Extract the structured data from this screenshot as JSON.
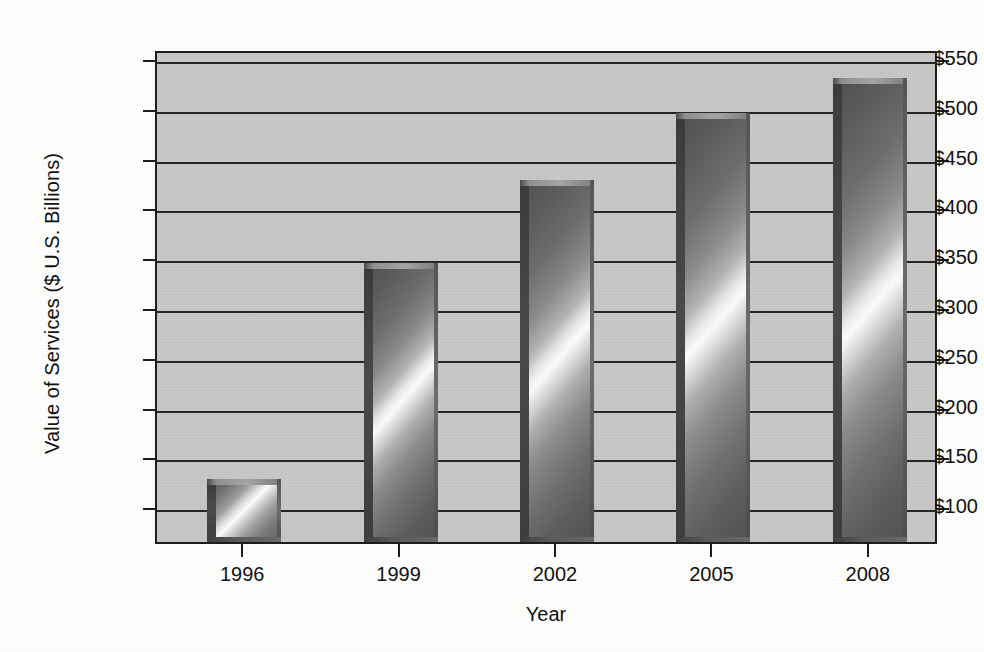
{
  "chart_data": {
    "type": "bar",
    "title": "",
    "xlabel": "Year",
    "ylabel": "Value of Services ($ U.S. Billions)",
    "categories": [
      "1996",
      "1999",
      "2002",
      "2005",
      "2008"
    ],
    "values": [
      128,
      345,
      428,
      496,
      531
    ],
    "ylim": [
      65,
      560
    ],
    "ytick_values": [
      100,
      150,
      200,
      250,
      300,
      350,
      400,
      450,
      500,
      550
    ],
    "ytick_labels": [
      "$100",
      "$150",
      "$200",
      "$250",
      "$300",
      "$350",
      "$400",
      "$450",
      "$500",
      "$550"
    ],
    "grid": true,
    "grid_axis": "y",
    "legend": false,
    "series": [
      {
        "name": "Value of Services",
        "values": [
          128,
          345,
          428,
          496,
          531
        ]
      }
    ],
    "colors": {
      "plot_background": "#c9c9c7",
      "bar_gradient_dark": "#4f4f4f",
      "bar_gradient_light": "#fbfbfb",
      "axis": "#1d1d1d",
      "gridline": "#262626",
      "text": "#121212",
      "figure_background": "#fdfdfc"
    }
  },
  "axes": {
    "x_title": "Year",
    "y_title": "Value of Services ($ U.S. Billions)"
  }
}
